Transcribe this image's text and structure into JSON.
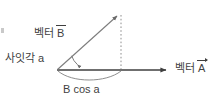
{
  "diagram": {
    "kind": "vector-projection-diagram",
    "background_color": "#ffffff",
    "ink_color": "#3f3f3f",
    "labels": {
      "vector_b_prefix": "벡터",
      "vector_b_symbol": "B",
      "angle_label": "사잇각 a",
      "vector_a_prefix": "벡터",
      "vector_a_symbol": "A",
      "projection_label": "B cos a"
    },
    "geometry": {
      "origin": {
        "x": 57,
        "y": 70
      },
      "vector_b_tip": {
        "x": 120,
        "y": 13
      },
      "vector_a_tip": {
        "x": 170,
        "y": 70
      },
      "projection_foot": {
        "x": 121,
        "y": 70
      },
      "dotted_drop_from": {
        "x": 121,
        "y": 15
      },
      "dotted_drop_to": {
        "x": 121,
        "y": 69
      },
      "angle_arc_radius": 20,
      "brace_sag_y": 79
    }
  }
}
